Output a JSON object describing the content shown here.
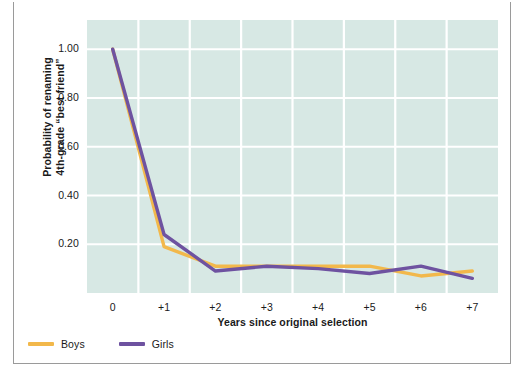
{
  "chart_data": {
    "type": "line",
    "title": "",
    "xlabel": "Years since original selection",
    "ylabel": "Probability of renaming 4th-grade “best friend”",
    "ylabel_line1": "Probability of renaming",
    "ylabel_line2": "4th-grade “best friend”",
    "x": [
      0,
      1,
      2,
      3,
      4,
      5,
      6,
      7
    ],
    "categories": [
      "0",
      "+1",
      "+2",
      "+3",
      "+4",
      "+5",
      "+6",
      "+7"
    ],
    "xticklabels": [
      "0",
      "+1",
      "+2",
      "+3",
      "+4",
      "+5",
      "+6",
      "+7"
    ],
    "yticklabels": [
      "0.20",
      "0.40",
      "0.60",
      "0.80",
      "1.00"
    ],
    "ytickvalues": [
      0.2,
      0.4,
      0.6,
      0.8,
      1.0
    ],
    "xlim": [
      -0.5,
      7.5
    ],
    "ylim": [
      0.0,
      1.12
    ],
    "grid": true,
    "grid_color": "#ffffff",
    "plot_background": "#d7e8e4",
    "legend_position": "below-plot-left",
    "series": [
      {
        "name": "Boys",
        "color": "#f2b84b",
        "values": [
          1.0,
          0.19,
          0.11,
          0.11,
          0.11,
          0.11,
          0.07,
          0.09
        ]
      },
      {
        "name": "Girls",
        "color": "#6e52a0",
        "values": [
          1.0,
          0.24,
          0.09,
          0.11,
          0.1,
          0.08,
          0.11,
          0.06
        ]
      }
    ]
  },
  "legend": {
    "items": [
      {
        "label": "Boys",
        "color": "#f2b84b"
      },
      {
        "label": "Girls",
        "color": "#6e52a0"
      }
    ]
  }
}
